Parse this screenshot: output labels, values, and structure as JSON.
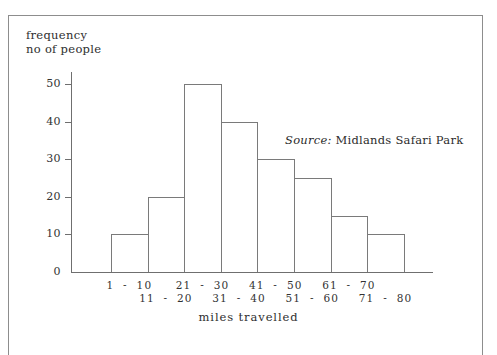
{
  "chart_data": {
    "type": "bar",
    "title": "",
    "subtitle": "",
    "xlabel": "miles travelled",
    "ylabel_line1": "frequency",
    "ylabel_line2": "no of people",
    "categories": [
      "1  -  10",
      "11  -  20",
      "21  -  30",
      "31  -  40",
      "41  -  50",
      "51  -  60",
      "61  -  70",
      "71  -  80"
    ],
    "values": [
      10,
      20,
      50,
      40,
      30,
      25,
      15,
      10
    ],
    "ylim": [
      0,
      50
    ],
    "yticks": [
      0,
      10,
      20,
      30,
      40,
      50
    ],
    "ytick_labels": [
      "0",
      "10",
      "20",
      "30",
      "40",
      "50"
    ],
    "grid": false,
    "legend": "none",
    "bar_style": "outlined-unfilled",
    "annotations": [
      {
        "name": "source-note",
        "keyword": "Source:",
        "text": "Midlands Safari Park"
      }
    ]
  },
  "colors": {
    "background": "#ffffff",
    "axis": "#6f6f6f",
    "bar_outline": "#7a7a7a",
    "text": "#2b2b2b",
    "frame": "#8d8d8d"
  }
}
